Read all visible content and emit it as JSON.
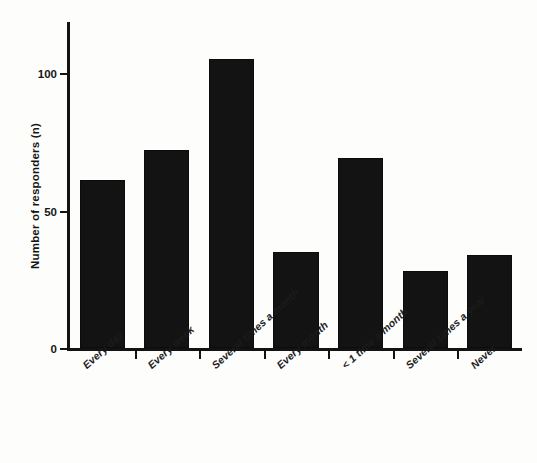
{
  "chart_data": {
    "type": "bar",
    "title": "",
    "subtitle": "",
    "xlabel": "",
    "ylabel": "Number of responders (n)",
    "categories": [
      "Every day",
      "Every week",
      "Several times a month",
      "Every month",
      "< 1 time a month",
      "Several times a year",
      "Never"
    ],
    "values": [
      61,
      72,
      105,
      35,
      69,
      28,
      34
    ],
    "ylim": [
      0,
      115
    ],
    "yticks": [
      0,
      50,
      100
    ],
    "ytick_labels": [
      "0",
      "50",
      "100"
    ],
    "grid": false,
    "legend": null,
    "bar_color": "#131313",
    "axis_color": "#131313",
    "background_color": "#fdfdfc"
  }
}
